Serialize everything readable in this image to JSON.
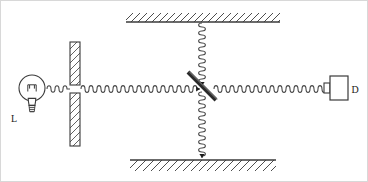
{
  "figure": {
    "width": 368,
    "height": 182,
    "background_color": "#ffffff",
    "line_color": "#3a3a3a",
    "ink_color": "#1a1a1a"
  },
  "labels": {
    "source_label": "L",
    "detector_label": "D"
  },
  "components": {
    "light_source": {
      "name": "light-bulb",
      "label": "L",
      "center_x": 32,
      "center_y": 88,
      "bulb_radius": 13
    },
    "aperture_wall": {
      "name": "vertical-hatched-barrier",
      "x": 70,
      "width": 10,
      "top_y": 42,
      "bottom_y": 146,
      "slit_top_y": 85,
      "slit_bottom_y": 93,
      "hatched": true
    },
    "top_mirror": {
      "name": "top-hatched-wall",
      "x1": 126,
      "x2": 280,
      "y": 22,
      "hatch_side": "above"
    },
    "bottom_mirror": {
      "name": "bottom-hatched-wall",
      "x1": 130,
      "x2": 276,
      "y": 160,
      "hatch_side": "below"
    },
    "beam_splitter": {
      "name": "beam-splitter",
      "x1": 188,
      "y1": 72,
      "x2": 216,
      "y2": 100,
      "thickness": 4,
      "angle_deg": 45
    },
    "detector": {
      "name": "detector-box",
      "label": "D",
      "x": 330,
      "y": 76,
      "width": 18,
      "height": 24,
      "tab_width": 6,
      "tab_height": 10
    }
  },
  "waves": {
    "source_to_slit": {
      "name": "wave-source-to-slit",
      "orientation": "horizontal",
      "from_x": 47,
      "to_x": 70,
      "y": 89,
      "amplitude": 3.2,
      "wavelength": 8,
      "arrow": false
    },
    "slit_to_splitter": {
      "name": "wave-slit-to-splitter",
      "orientation": "horizontal",
      "from_x": 81,
      "to_x": 200,
      "y": 89,
      "amplitude": 3.4,
      "wavelength": 8,
      "arrow": true,
      "arrow_direction": "right"
    },
    "splitter_to_detector": {
      "name": "wave-splitter-to-detector",
      "orientation": "horizontal",
      "from_x": 214,
      "to_x": 328,
      "y": 89,
      "amplitude": 3.4,
      "wavelength": 8,
      "arrow": true,
      "arrow_direction": "right"
    },
    "splitter_to_top": {
      "name": "wave-splitter-to-top-mirror",
      "orientation": "vertical",
      "x": 202,
      "from_y": 23,
      "to_y": 86,
      "amplitude": 3.4,
      "wavelength": 8,
      "arrow": true,
      "arrow_direction": "down"
    },
    "splitter_to_bottom": {
      "name": "wave-splitter-to-bottom-mirror",
      "orientation": "vertical",
      "x": 202,
      "from_y": 92,
      "to_y": 158,
      "amplitude": 3.4,
      "wavelength": 8,
      "arrow": true,
      "arrow_direction": "down"
    }
  }
}
